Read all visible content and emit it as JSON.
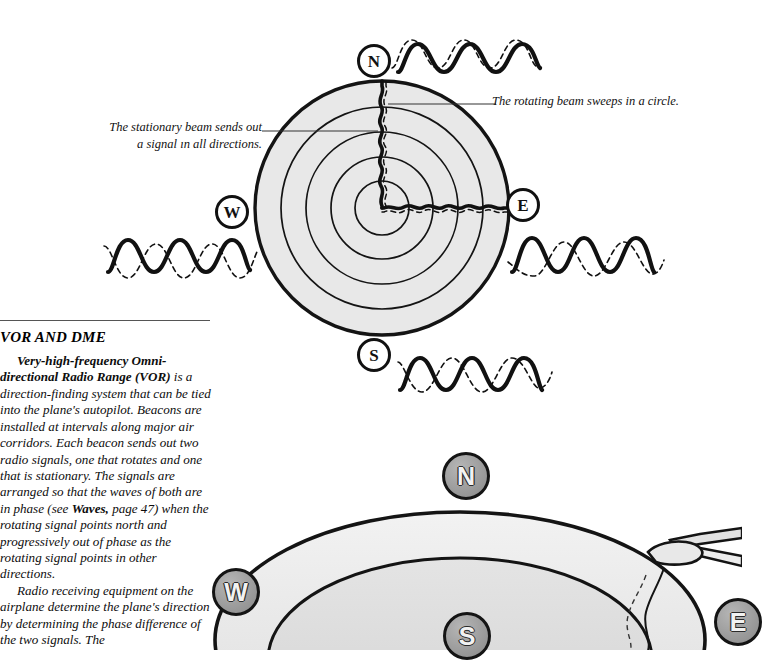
{
  "page": {
    "width": 742,
    "height": 650,
    "background": "#ffffff"
  },
  "top_figure": {
    "name": "vor-beacon-radiation-diagram",
    "callouts": [
      {
        "id": "stationary",
        "text": "The stationary beam sends out\na signal ın all directions."
      },
      {
        "id": "rotating",
        "text": "The rotating beam sweeps in a circle."
      }
    ],
    "compass_badges": [
      {
        "id": "n",
        "label": "N"
      },
      {
        "id": "w",
        "label": "W"
      },
      {
        "id": "e",
        "label": "E"
      },
      {
        "id": "s",
        "label": "S"
      }
    ],
    "rings": {
      "count": 5,
      "fill": "#e8e8e8",
      "stroke": "#141414"
    },
    "waves": [
      {
        "id": "north",
        "phase_label": "in phase",
        "phase_offset_deg": 12
      },
      {
        "id": "west",
        "phase_label": "out of phase",
        "phase_offset_deg": 250
      },
      {
        "id": "east",
        "phase_label": "out of phase",
        "phase_offset_deg": 110
      },
      {
        "id": "south",
        "phase_label": "fully out of phase",
        "phase_offset_deg": 180
      }
    ]
  },
  "article": {
    "heading": "VOR AND DME",
    "paragraphs": [
      {
        "lead_bold": "Very-high-frequency Omni-directional Radio Range (VOR)",
        "rest": " is a direction-finding system that can be tied into the plane's autopilot. Beacons are installed at intervals along major air corridors. Each beacon sends out two radio signals, one that rotates and one that is stationary. The signals are arranged so that the waves of both are in phase (see ",
        "bold_ref": "Waves,",
        "rest2": " page 47) when the rotating signal points north and progressively out of phase as the rotating signal points in other directions."
      },
      {
        "text": "Radio receiving equipment on the airplane determine the plane's direction by determining the phase difference of the two signals. The"
      }
    ]
  },
  "bottom_figure": {
    "name": "vor-coverage-perspective-diagram",
    "compass_badges": [
      {
        "id": "n",
        "label": "N"
      },
      {
        "id": "w",
        "label": "W"
      },
      {
        "id": "s",
        "label": "S"
      },
      {
        "id": "e",
        "label": "E"
      }
    ],
    "has_airplane": true,
    "fill_light": "#ededed",
    "fill_mid": "#dcdcdc",
    "stroke": "#141414"
  },
  "colors": {
    "ink": "#111111",
    "ring_fill": "#e8e8e8",
    "badge_gray": "#9a9a9a",
    "rule": "#555555"
  }
}
